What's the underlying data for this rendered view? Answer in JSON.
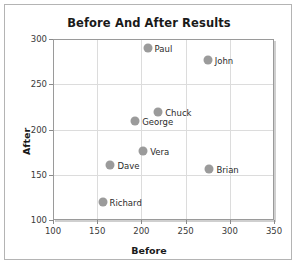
{
  "chart_data": {
    "type": "scatter",
    "title": "Before And After Results",
    "xlabel": "Before",
    "ylabel": "After",
    "xlim": [
      100,
      350
    ],
    "ylim": [
      100,
      300
    ],
    "xticks": [
      100,
      150,
      200,
      250,
      300,
      350
    ],
    "yticks": [
      100,
      150,
      200,
      250,
      300
    ],
    "grid": true,
    "legend": "none",
    "point_color": "#9b9b9b",
    "points": [
      {
        "label": "Paul",
        "x": 207,
        "y": 290
      },
      {
        "label": "John",
        "x": 275,
        "y": 277
      },
      {
        "label": "Chuck",
        "x": 219,
        "y": 219
      },
      {
        "label": "George",
        "x": 193,
        "y": 209
      },
      {
        "label": "Vera",
        "x": 202,
        "y": 176
      },
      {
        "label": "Dave",
        "x": 165,
        "y": 161
      },
      {
        "label": "Brian",
        "x": 277,
        "y": 156
      },
      {
        "label": "Richard",
        "x": 156,
        "y": 120
      }
    ]
  }
}
